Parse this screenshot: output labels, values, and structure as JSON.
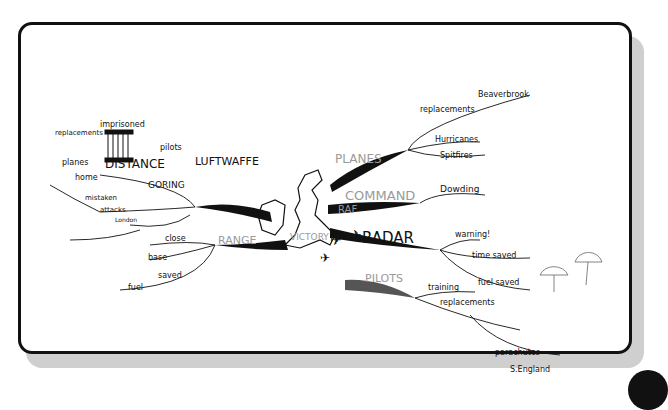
{
  "center": {
    "label": "RAF",
    "sublabel": "VICTORY"
  },
  "branches": {
    "planes": {
      "label": "PLANES",
      "children": [
        "replacements",
        "Beaverbrook",
        "Hurricanes",
        "Spitfires"
      ]
    },
    "command": {
      "label": "COMMAND",
      "children": [
        "Dowding"
      ]
    },
    "radar": {
      "label": "RADAR",
      "children": [
        "warning!",
        "time saved",
        "fuel saved"
      ]
    },
    "pilots": {
      "label": "PILOTS",
      "children": [
        "training",
        "replacements",
        "parachutes",
        "S.England"
      ]
    },
    "range": {
      "label": "RANGE",
      "children": [
        "close",
        "base",
        "fuel",
        "saved"
      ]
    },
    "luftwaffe": {
      "label": "LUFTWAFFE",
      "children": [
        "pilots",
        "imprisoned",
        "DISTANCE",
        "replacements",
        "planes",
        "home",
        "GORING",
        "mistaken",
        "attacks",
        "London"
      ]
    }
  },
  "colors": {
    "ink": "#111111",
    "pencil": "#9a9a9a",
    "shadow": "#cfcfcf"
  }
}
